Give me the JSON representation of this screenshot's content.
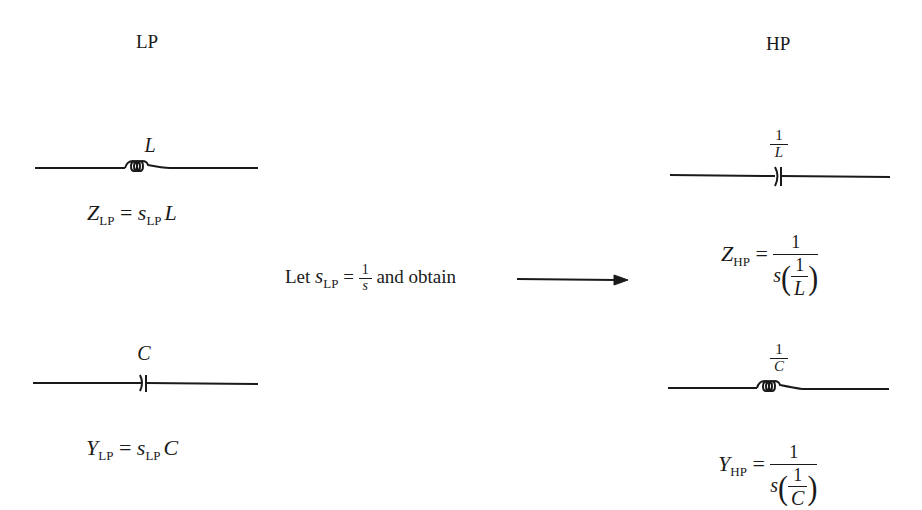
{
  "headers": {
    "lp": "LP",
    "hp": "HP"
  },
  "lp": {
    "inductor": {
      "label": "L",
      "equation": {
        "lhs": "Z",
        "lhs_sub": "LP",
        "eq": "=",
        "rhs_var": "s",
        "rhs_sub": "LP",
        "rhs_elem": "L"
      }
    },
    "capacitor": {
      "label": "C",
      "equation": {
        "lhs": "Y",
        "lhs_sub": "LP",
        "eq": "=",
        "rhs_var": "s",
        "rhs_sub": "LP",
        "rhs_elem": "C"
      }
    }
  },
  "transform": {
    "prefix": "Let",
    "var": "s",
    "var_sub": "LP",
    "eq": "=",
    "frac_num": "1",
    "frac_den": "s",
    "suffix": "and obtain",
    "arrow": "right-arrow"
  },
  "hp": {
    "capacitor": {
      "label_num": "1",
      "label_den": "L",
      "equation": {
        "lhs": "Z",
        "lhs_sub": "HP",
        "eq": "=",
        "num": "1",
        "den_var": "s",
        "den_frac_num": "1",
        "den_frac_den": "L"
      }
    },
    "inductor": {
      "label_num": "1",
      "label_den": "C",
      "equation": {
        "lhs": "Y",
        "lhs_sub": "HP",
        "eq": "=",
        "num": "1",
        "den_var": "s",
        "den_frac_num": "1",
        "den_frac_den": "C"
      }
    }
  },
  "colors": {
    "ink": "#1a1a1a",
    "background": "#ffffff"
  }
}
